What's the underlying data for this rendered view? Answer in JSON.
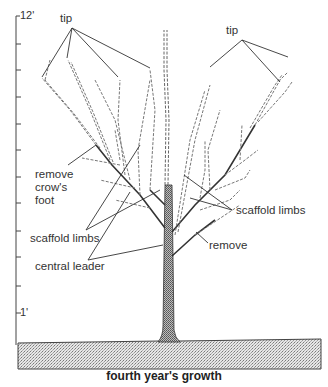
{
  "figure": {
    "caption": "fourth year's growth",
    "ruler": {
      "top_label": "12'",
      "bottom_label": "1'",
      "tick_count": 12
    },
    "labels": {
      "tip_left": "tip",
      "tip_right": "tip",
      "remove_crows_foot": "remove\ncrow's\nfoot",
      "scaffold_limbs_left": "scaffold limbs",
      "scaffold_limbs_right": "scaffold limbs",
      "remove": "remove",
      "central_leader": "central leader"
    }
  },
  "colors": {
    "ink": "#333333",
    "ground": "#c8c8c8",
    "trunk": "#8a8a8a"
  }
}
